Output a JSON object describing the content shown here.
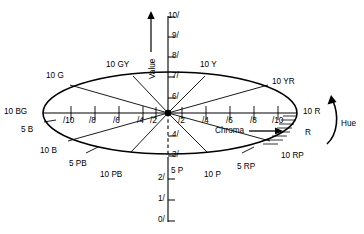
{
  "figure": {
    "type": "diagram",
    "axis_labels": {
      "value": "Value",
      "chroma": "Chroma",
      "hue": "Hue"
    },
    "colors": {
      "line": "#000000",
      "background": "#ffffff"
    }
  },
  "value_axis": {
    "label": "Value",
    "arrow": "up-arrow-icon",
    "ticks": [
      {
        "label": "10/",
        "value": 10,
        "x": 168,
        "y": 16
      },
      {
        "label": "9/",
        "value": 9,
        "x": 172,
        "y": 35
      },
      {
        "label": "8/",
        "value": 8,
        "x": 172,
        "y": 55
      },
      {
        "label": "7/",
        "value": 7,
        "x": 172,
        "y": 74
      },
      {
        "label": "6/",
        "value": 6,
        "x": 172,
        "y": 96
      },
      {
        "label": "4/",
        "value": 4,
        "x": 172,
        "y": 134
      },
      {
        "label": "3/",
        "value": 3,
        "x": 172,
        "y": 154
      },
      {
        "label": "2/",
        "value": 2,
        "x": 172,
        "y": 177
      },
      {
        "label": "1/",
        "value": 1,
        "x": 172,
        "y": 198
      },
      {
        "label": "0/",
        "value": 0,
        "x": 172,
        "y": 219
      }
    ]
  },
  "chroma_axis": {
    "label": "Chroma",
    "arrow": "right-arrow-icon",
    "left_ticks": [
      "/10",
      "/8",
      "/6",
      "/4",
      "/2"
    ],
    "right_ticks": [
      "/2",
      "/4",
      "/6",
      "/8",
      "/10"
    ]
  },
  "hue_axis": {
    "label": "Hue",
    "arrow": "curved-arrow-icon"
  },
  "hue_labels": [
    {
      "name": "10 G",
      "x": 46,
      "y": 72
    },
    {
      "name": "10 GY",
      "x": 106,
      "y": 61
    },
    {
      "name": "10 Y",
      "x": 200,
      "y": 61
    },
    {
      "name": "10 YR",
      "x": 272,
      "y": 78
    },
    {
      "name": "10 BG",
      "x": 6,
      "y": 108
    },
    {
      "name": "10 R",
      "x": 304,
      "y": 108
    },
    {
      "name": "5 B",
      "x": 22,
      "y": 126
    },
    {
      "name": "R",
      "x": 307,
      "y": 128
    },
    {
      "name": "10 B",
      "x": 40,
      "y": 148
    },
    {
      "name": "10 RP",
      "x": 283,
      "y": 152
    },
    {
      "name": "5 PB",
      "x": 70,
      "y": 160
    },
    {
      "name": "5 RP",
      "x": 238,
      "y": 165
    },
    {
      "name": "10 PB",
      "x": 101,
      "y": 171
    },
    {
      "name": "10 P",
      "x": 205,
      "y": 172
    },
    {
      "name": "5 P",
      "x": 172,
      "y": 170
    }
  ],
  "center": {
    "x": 168,
    "y": 113,
    "label": "5/"
  },
  "ellipse": {
    "cx": 170,
    "cy": 113,
    "rx": 127,
    "ry": 41
  },
  "hatched_region": {
    "name": "red-chroma-extension",
    "side": "right-lower"
  }
}
